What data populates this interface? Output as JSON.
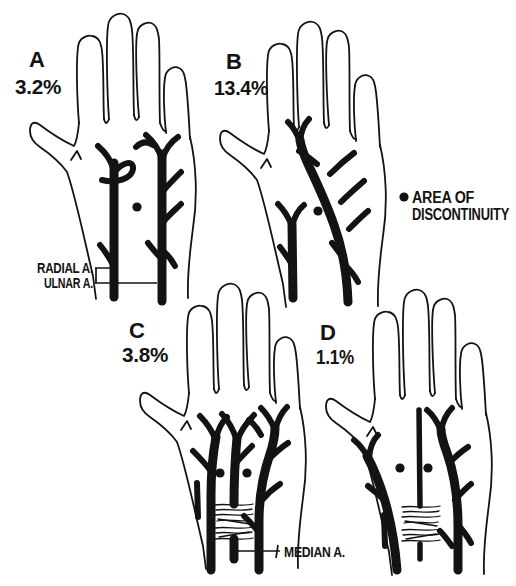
{
  "figure": {
    "variants": [
      {
        "letter": "A",
        "percent": "3.2%"
      },
      {
        "letter": "B",
        "percent": "13.4%"
      },
      {
        "letter": "C",
        "percent": "3.8%"
      },
      {
        "letter": "D",
        "percent": "1.1%"
      }
    ],
    "anatomy_labels": {
      "radial": "RADIAL A.",
      "ulnar": "ULNAR A.",
      "median": "MEDIAN A."
    },
    "legend": {
      "line1": "AREA OF",
      "line2": "DISCONTINUITY"
    },
    "colors": {
      "ink": "#131313",
      "background": "#ffffff"
    }
  }
}
